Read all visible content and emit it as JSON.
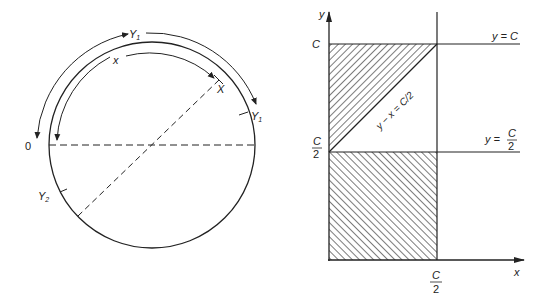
{
  "left_diagram": {
    "labels": {
      "origin": "0",
      "arc_outer": "Y",
      "arc_outer_sub": "1",
      "arc_inner": "x",
      "point_x": "X",
      "point_y1": "Y",
      "point_y1_sub": "1",
      "point_y2": "Y",
      "point_y2_sub": "2"
    }
  },
  "right_diagram": {
    "axis_y": "y",
    "axis_x": "x",
    "tick_c": "C",
    "tick_c_half_num": "C",
    "tick_c_half_den": "2",
    "tick_x_half_num": "C",
    "tick_x_half_den": "2",
    "line_top_label": "y = C",
    "line_mid_label_prefix": "y =",
    "line_mid_label_num": "C",
    "line_mid_label_den": "2",
    "diag_label": "y − x = C/2"
  },
  "colors": {
    "stroke": "#222222",
    "background": "#ffffff"
  }
}
